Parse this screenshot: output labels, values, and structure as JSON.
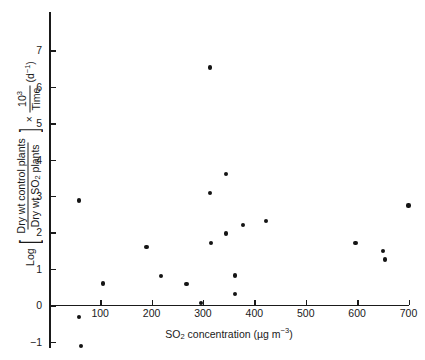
{
  "chart_data": {
    "type": "scatter",
    "title": "",
    "xlabel": "SO2 concentration (µg m-3)",
    "ylabel": "Log [Dry wt control plants / Dry wt SO2 plants] × 10^3/Time (d-1)",
    "xlim": [
      0,
      700
    ],
    "ylim": [
      -1,
      7
    ],
    "grid": false,
    "legend": null,
    "xticks": [
      100,
      200,
      300,
      400,
      500,
      600,
      700
    ],
    "yticks": [
      -1,
      0,
      1,
      2,
      3,
      4,
      5,
      6,
      7
    ],
    "points": [
      {
        "x": 58,
        "y": 2.88
      },
      {
        "x": 58,
        "y": -0.32
      },
      {
        "x": 63,
        "y": -1.12
      },
      {
        "x": 105,
        "y": 0.6
      },
      {
        "x": 190,
        "y": 1.6
      },
      {
        "x": 218,
        "y": 0.8
      },
      {
        "x": 268,
        "y": 0.58
      },
      {
        "x": 313,
        "y": 6.53
      },
      {
        "x": 313,
        "y": 3.08
      },
      {
        "x": 345,
        "y": 3.6
      },
      {
        "x": 315,
        "y": 1.72
      },
      {
        "x": 345,
        "y": 1.97
      },
      {
        "x": 378,
        "y": 2.2
      },
      {
        "x": 362,
        "y": 0.82
      },
      {
        "x": 362,
        "y": 0.3
      },
      {
        "x": 296,
        "y": 0.07
      },
      {
        "x": 423,
        "y": 2.31
      },
      {
        "x": 597,
        "y": 1.72
      },
      {
        "x": 650,
        "y": 1.5
      },
      {
        "x": 655,
        "y": 1.26
      },
      {
        "x": 700,
        "y": 2.74
      }
    ]
  },
  "axis_titles": {
    "x_species": "SO",
    "x_species_sub": "2",
    "x_rest": " concentration (",
    "x_unit_mu": "µg m",
    "x_unit_sup": "−3",
    "x_close": ")",
    "y_log": "Log",
    "y_num": "Dry wt control plants",
    "y_den_a": "Dry wt SO",
    "y_den_sub": "2",
    "y_den_b": " plants",
    "y_times": "×",
    "y_frac_num": "10",
    "y_frac_num_sup": "3",
    "y_frac_den": "Time",
    "y_unit": "(d",
    "y_unit_sup": "−1",
    "y_unit_close": ")"
  },
  "colors": {
    "background": "#ffffff",
    "axis": "#1a1a1a",
    "marker": "#141414"
  }
}
